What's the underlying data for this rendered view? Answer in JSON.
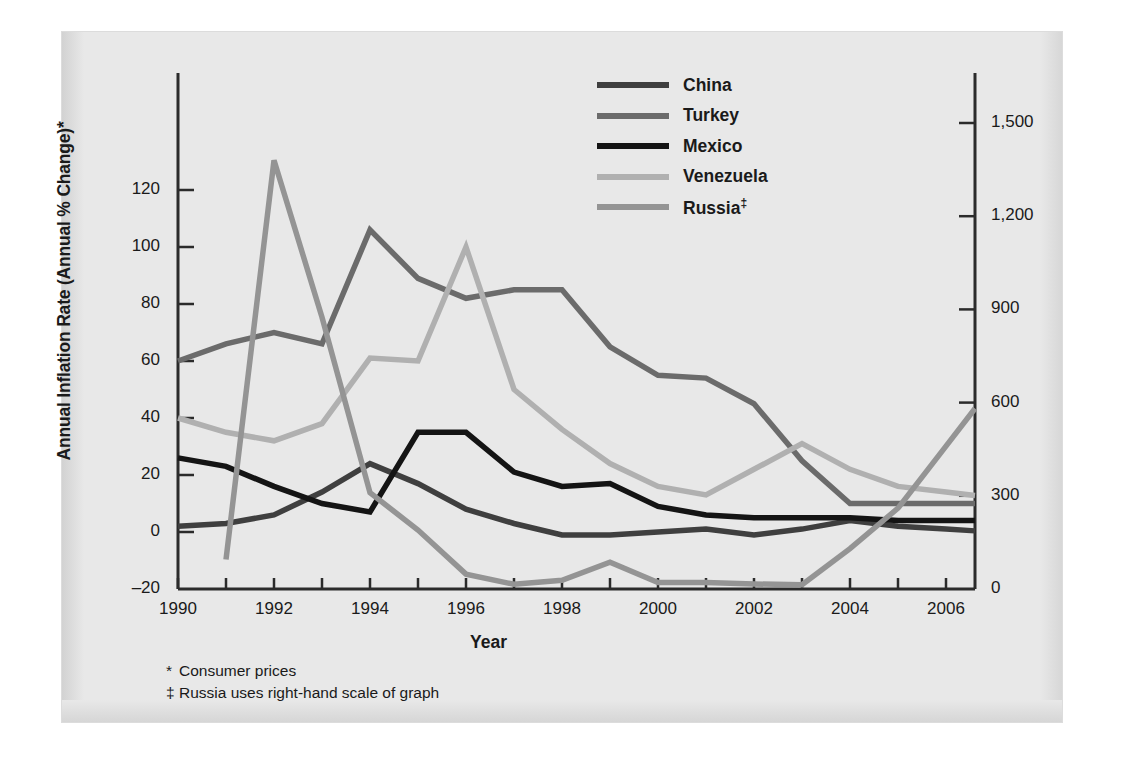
{
  "chart_data": {
    "type": "line",
    "title": "",
    "xlabel": "Year",
    "ylabel": "Annual Inflation Rate (Annual % Change)*",
    "ylabel_right": "",
    "xlim": [
      1990,
      2006.6
    ],
    "ylim": [
      -20,
      145
    ],
    "ylim_right": [
      0,
      1725
    ],
    "grid": false,
    "legend_position": "top-right",
    "x_ticks": [
      1990,
      1991,
      1992,
      1993,
      1994,
      1995,
      1996,
      1997,
      1998,
      1999,
      2000,
      2001,
      2002,
      2003,
      2004,
      2005,
      2006
    ],
    "x_tick_labels": [
      "1990",
      "",
      "1992",
      "",
      "1994",
      "",
      "1996",
      "",
      "1998",
      "",
      "2000",
      "",
      "2002",
      "",
      "2004",
      "",
      "2006"
    ],
    "y_ticks_left": [
      -20,
      0,
      20,
      40,
      60,
      80,
      100,
      120
    ],
    "y_tick_labels_left": [
      "–20",
      "0",
      "20",
      "40",
      "60",
      "80",
      "100",
      "120"
    ],
    "y_ticks_right": [
      0,
      300,
      600,
      900,
      1200,
      1500
    ],
    "y_tick_labels_right": [
      "0",
      "300",
      "600",
      "900",
      "1,200",
      "1,500"
    ],
    "x": [
      1990,
      1991,
      1992,
      1993,
      1994,
      1995,
      1996,
      1997,
      1998,
      1999,
      2000,
      2001,
      2002,
      2003,
      2004,
      2005,
      2006
    ],
    "series": [
      {
        "name": "China",
        "color": "#3f3f3f",
        "axis": "left",
        "values": [
          2,
          3,
          6,
          14,
          24,
          17,
          8,
          3,
          -1,
          -1,
          0,
          1,
          -1,
          1,
          4,
          2,
          1
        ]
      },
      {
        "name": "Turkey",
        "color": "#6b6b6b",
        "axis": "left",
        "values": [
          60,
          66,
          70,
          66,
          106,
          89,
          82,
          85,
          85,
          65,
          55,
          54,
          45,
          25,
          10,
          10,
          10
        ]
      },
      {
        "name": "Mexico",
        "color": "#141414",
        "axis": "left",
        "values": [
          26,
          23,
          16,
          10,
          7,
          35,
          35,
          21,
          16,
          17,
          9,
          6,
          5,
          5,
          5,
          4,
          4
        ]
      },
      {
        "name": "Venezuela",
        "color": "#b0b0b0",
        "axis": "left",
        "values": [
          40,
          35,
          32,
          38,
          61,
          60,
          100,
          50,
          36,
          24,
          16,
          13,
          22,
          31,
          22,
          16,
          14
        ]
      },
      {
        "name": "Russia‡",
        "color": "#949494",
        "axis": "right",
        "values": [
          null,
          95,
          1380,
          875,
          310,
          190,
          48,
          15,
          28,
          86,
          21,
          21,
          16,
          14,
          130,
          260,
          460
        ]
      }
    ]
  },
  "legend": {
    "items": [
      {
        "label": "China",
        "sup": "",
        "color": "#3f3f3f"
      },
      {
        "label": "Turkey",
        "sup": "",
        "color": "#6b6b6b"
      },
      {
        "label": "Mexico",
        "sup": "",
        "color": "#141414"
      },
      {
        "label": "Venezuela",
        "sup": "",
        "color": "#b0b0b0"
      },
      {
        "label": "Russia",
        "sup": "‡",
        "color": "#949494"
      }
    ]
  },
  "footnotes": [
    {
      "mark": "*",
      "text": "Consumer prices"
    },
    {
      "mark": "‡",
      "text": "Russia uses right-hand scale of graph"
    }
  ]
}
